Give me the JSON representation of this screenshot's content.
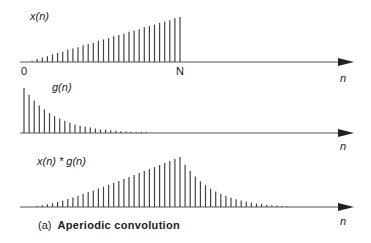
{
  "diagram": {
    "caption_prefix": "(a)",
    "caption_title": "Aperiodic convolution",
    "panels": [
      {
        "name": "x",
        "label": "x(n)",
        "axis_label": "n",
        "tick_start": "0",
        "tick_end": "N"
      },
      {
        "name": "g",
        "label": "g(n)",
        "axis_label": "n"
      },
      {
        "name": "conv",
        "label": "x(n) * g(n)",
        "axis_label": "n"
      }
    ]
  },
  "chart_data": [
    {
      "type": "stem",
      "title": "x(n)",
      "description": "linear ramp from 0 to N, zero beyond N",
      "n_start": 0,
      "n_end": 30,
      "values": [
        0.0,
        0.03,
        0.07,
        0.1,
        0.13,
        0.17,
        0.2,
        0.23,
        0.27,
        0.3,
        0.33,
        0.37,
        0.4,
        0.43,
        0.47,
        0.5,
        0.53,
        0.57,
        0.6,
        0.63,
        0.67,
        0.7,
        0.73,
        0.77,
        0.8,
        0.83,
        0.87,
        0.9,
        0.93,
        0.97,
        1.0
      ],
      "xlabel": "n",
      "tick_labels": [
        "0",
        "N"
      ]
    },
    {
      "type": "stem",
      "title": "g(n)",
      "description": "decaying exponential",
      "values": [
        1.0,
        0.85,
        0.72,
        0.61,
        0.52,
        0.44,
        0.37,
        0.32,
        0.27,
        0.23,
        0.19,
        0.16,
        0.14,
        0.12,
        0.1,
        0.08,
        0.07,
        0.06,
        0.05,
        0.04,
        0.035,
        0.03,
        0.025,
        0.02,
        0.015
      ],
      "xlabel": "n"
    },
    {
      "type": "stem",
      "title": "x(n) * g(n)",
      "description": "aperiodic convolution: rising ramp, peak at N, then exponential decay",
      "xlabel": "n"
    }
  ]
}
